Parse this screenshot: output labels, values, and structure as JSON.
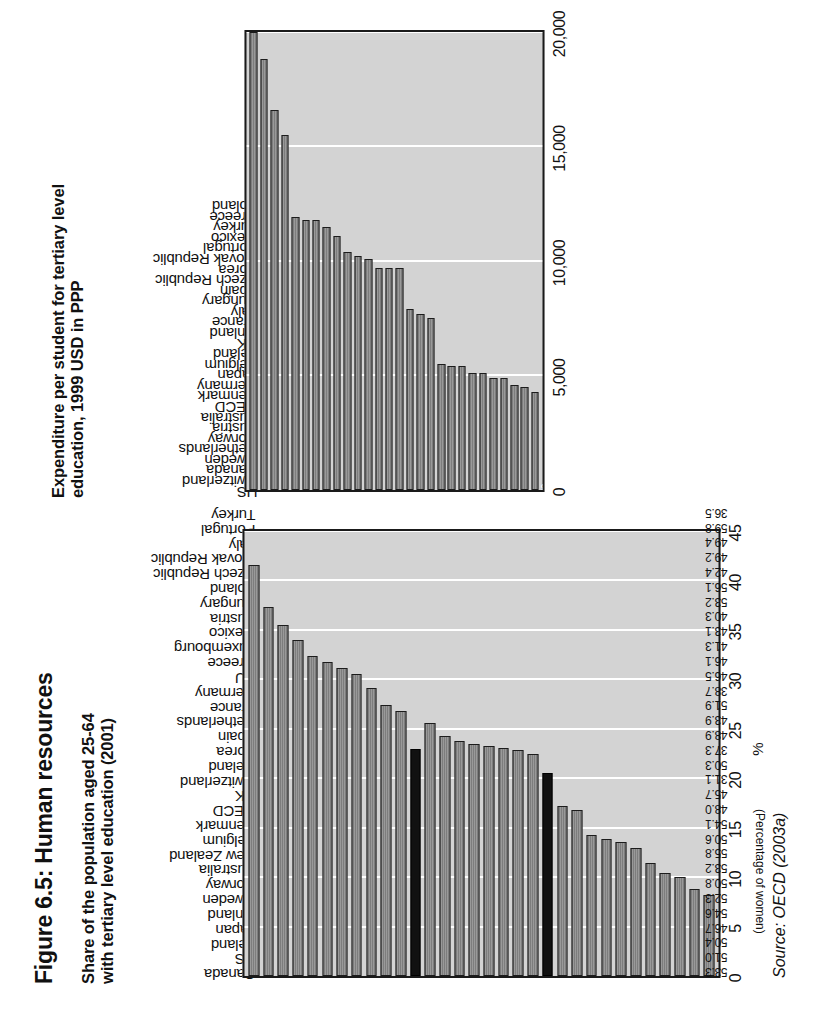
{
  "page": {
    "figure_title": "Figure 6.5: Human resources",
    "source": "Source: OECD (2003a)"
  },
  "chart_data": [
    {
      "id": "tertiary-share",
      "type": "bar",
      "orientation": "vertical",
      "title": "Share of the population aged 25-64\nwith tertiary level education (2001)",
      "xlabel": "",
      "ylabel": "%",
      "secondary_axis_label": "(Percentage of women)",
      "ylim": [
        0,
        45
      ],
      "yticks": [
        0,
        5,
        10,
        15,
        20,
        25,
        30,
        35,
        40,
        45
      ],
      "grid": true,
      "highlight_color": "#111111",
      "bar_color": "#7d7d7d",
      "highlighted": [
        "OECD",
        "EU"
      ],
      "categories": [
        "Canada",
        "US",
        "Ireland",
        "Japan",
        "Finland",
        "Sweden",
        "Norway",
        "Australia",
        "New Zealand",
        "Belgium",
        "Denmark",
        "OECD",
        "UK",
        "Switzerland",
        "Iceland",
        "Korea",
        "Spain",
        "Netherlands",
        "France",
        "Germany",
        "EU",
        "Greece",
        "Luxembourg",
        "Mexico",
        "Austria",
        "Hungary",
        "Poland",
        "Czech Republic",
        "Slovak Republic",
        "Italy",
        "Portugal",
        "Turkey"
      ],
      "values": [
        41.6,
        37.3,
        35.5,
        34.0,
        32.4,
        31.8,
        31.1,
        30.5,
        29.1,
        27.4,
        26.8,
        23.0,
        25.6,
        24.3,
        23.8,
        23.5,
        23.3,
        23.1,
        22.9,
        22.4,
        20.5,
        17.2,
        16.8,
        14.3,
        13.9,
        13.6,
        12.9,
        11.4,
        10.4,
        10.0,
        8.8,
        8.2
      ],
      "value_labels": [
        "53.3",
        "51.0",
        "50.4",
        "46.7",
        "54.6",
        "52.3",
        "50.8",
        "53.2",
        "55.8",
        "50.6",
        "54.1",
        "48.0",
        "45.7",
        "31.1",
        "50.3",
        "37.3",
        "48.9",
        "43.9",
        "51.9",
        "38.7",
        "46.5",
        "46.1",
        "41.3",
        "43.1",
        "40.3",
        "53.2",
        "56.1",
        "42.4",
        "49.2",
        "49.4",
        "59.8",
        "36.5"
      ]
    },
    {
      "id": "tertiary-expenditure",
      "type": "bar",
      "orientation": "vertical",
      "title": "Expenditure per student for tertiary level\neducation, 1999 USD in PPP",
      "xlabel": "",
      "ylabel": "",
      "ylim": [
        0,
        20000
      ],
      "yticks": [
        "0",
        "5,000",
        "10,000",
        "15,000",
        "20,000"
      ],
      "grid": true,
      "bar_color": "#7d7d7d",
      "first_bar_label": "43",
      "categories": [
        "US",
        "Switzerland",
        "Canada",
        "Sweden",
        "Netherlands",
        "Norway",
        "Austria",
        "Australia",
        "OECD",
        "Denmark",
        "Germany",
        "Japan",
        "Belgium",
        "Ireland",
        "UK",
        "Finland",
        "France",
        "Italy",
        "Hungary",
        "Spain",
        "Czech Republic",
        "Korea",
        "Slovak Republic",
        "Portugal",
        "Mexico",
        "Turkey",
        "Greece",
        "Poland"
      ],
      "values": [
        21500,
        18800,
        16600,
        15500,
        11900,
        11800,
        11800,
        11500,
        11100,
        10400,
        10200,
        10100,
        9700,
        9700,
        9700,
        7900,
        7700,
        7500,
        5500,
        5400,
        5400,
        5100,
        5100,
        4900,
        4900,
        4600,
        4500,
        4300
      ]
    }
  ]
}
